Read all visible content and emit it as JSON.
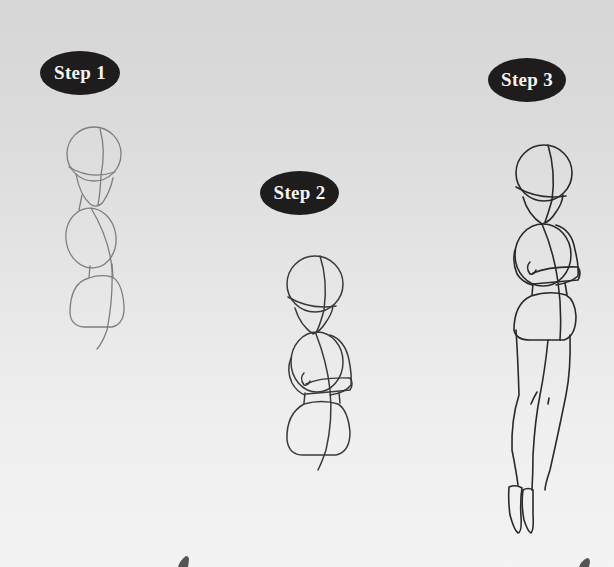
{
  "steps": [
    {
      "label": "Step 1",
      "description": "light construction shapes: head circle, torso oval, hip shape, center line"
    },
    {
      "label": "Step 2",
      "description": "darker head, chest and hip shapes with folded arm guides"
    },
    {
      "label": "Step 3",
      "description": "full figure with legs and feet"
    }
  ],
  "colors": {
    "badge_bg": "#1e1c1c",
    "badge_text": "#f4f4f4",
    "background_top": "#d6d6d6",
    "background_bottom": "#f3f3f3",
    "sketch_light": "#7e7e7e",
    "sketch_dark": "#2a2a2a"
  }
}
